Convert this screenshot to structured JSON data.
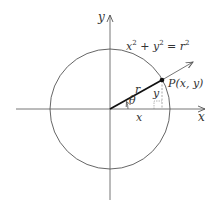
{
  "diagram": {
    "type": "polar-coordinates-circle",
    "colors": {
      "background": "#ffffff",
      "line": "#555555",
      "radius": "#111111",
      "text": "#333333"
    },
    "labels": {
      "y_axis_top": "y",
      "x_axis_right": "x",
      "equation": "x² + y² = r²",
      "point": "P(x, y)",
      "radius": "r",
      "theta": "θ",
      "x_leg": "x",
      "y_leg": "y"
    },
    "geometry": {
      "origin": [
        110,
        109
      ],
      "circle_radius": 60,
      "point_P": [
        162,
        80
      ],
      "ray_end": [
        193,
        62
      ]
    }
  }
}
